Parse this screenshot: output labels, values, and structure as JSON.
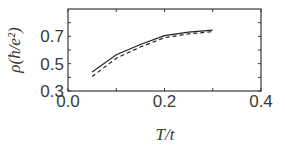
{
  "chart_data": {
    "type": "line",
    "title": "",
    "xlabel": "T/t",
    "ylabel": "ρ(ħ/e²)",
    "xlim": [
      0.0,
      0.4
    ],
    "ylim": [
      0.3,
      0.9
    ],
    "xticks": [
      0.0,
      0.2,
      0.4
    ],
    "xtick_labels": [
      "0.0",
      "0.2",
      "0.4"
    ],
    "xminor_ticks": [
      0.1,
      0.3
    ],
    "yticks": [
      0.3,
      0.5,
      0.7
    ],
    "ytick_labels": [
      "0.3",
      "0.5",
      "0.7"
    ],
    "yminor_ticks": [
      0.4,
      0.6,
      0.8
    ],
    "grid": false,
    "legend": null,
    "x": [
      0.05,
      0.1,
      0.15,
      0.2,
      0.25,
      0.3
    ],
    "series": [
      {
        "name": "solid",
        "style": "solid",
        "color": "#222222",
        "values": [
          0.44,
          0.565,
          0.64,
          0.705,
          0.73,
          0.745
        ]
      },
      {
        "name": "dashed",
        "style": "dashed",
        "color": "#222222",
        "values": [
          0.405,
          0.54,
          0.622,
          0.69,
          0.718,
          0.735
        ]
      }
    ]
  }
}
